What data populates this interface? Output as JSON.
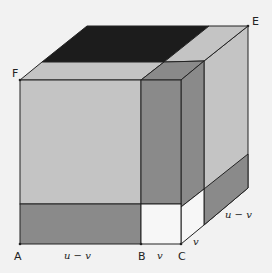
{
  "diagram": {
    "points": {
      "A": "A",
      "B": "B",
      "C": "C",
      "E": "E",
      "F": "F"
    },
    "lengths": {
      "AB": "u − v",
      "BC": "v",
      "depth_v": "v",
      "depth_u_minus_v": "u − v"
    },
    "colors": {
      "background": "#f2f2f2",
      "light_gray": "#c4c4c4",
      "mid_gray": "#8a8a8a",
      "dark": "#1c1c1c",
      "white": "#f7f7f7",
      "edge": "#222222"
    }
  }
}
